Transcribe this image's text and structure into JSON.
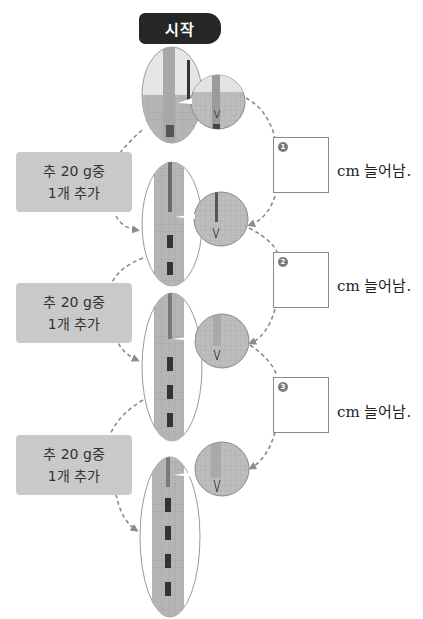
{
  "start_label": "시작",
  "steps": [
    {
      "line1": "추 20 g중",
      "line2": "1개 추가"
    },
    {
      "line1": "추 20 g중",
      "line2": "1개 추가"
    },
    {
      "line1": "추 20 g중",
      "line2": "1개 추가"
    }
  ],
  "answers": [
    {
      "number": "1",
      "value": "",
      "unit": "cm 늘어남."
    },
    {
      "number": "2",
      "value": "",
      "unit": "cm 늘어남."
    },
    {
      "number": "3",
      "value": "",
      "unit": "cm 늘어남."
    }
  ],
  "photos": [
    {
      "weights": 0,
      "label": "spring-no-weight"
    },
    {
      "weights": 1,
      "label": "spring-one-weight"
    },
    {
      "weights": 2,
      "label": "spring-two-weights"
    },
    {
      "weights": 3,
      "label": "spring-three-weights"
    }
  ],
  "colors": {
    "badge_bg": "#262626",
    "step_box_bg": "#c9c9c9",
    "arrow": "#8c8c8c",
    "photo_bg": "#b9b9b9"
  }
}
